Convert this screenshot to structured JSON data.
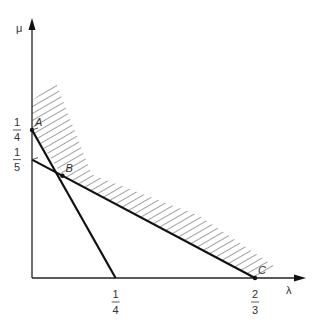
{
  "chart_data": {
    "type": "line",
    "title": "",
    "xlabel": "λ",
    "ylabel": "μ",
    "xlim": [
      0,
      0.76
    ],
    "ylim": [
      0,
      0.46
    ],
    "x_ticks": [
      {
        "value": 0.25,
        "num": "1",
        "den": "4"
      },
      {
        "value": 0.6667,
        "num": "2",
        "den": "3"
      }
    ],
    "y_ticks": [
      {
        "value": 0.25,
        "num": "1",
        "den": "4"
      },
      {
        "value": 0.2,
        "num": "1",
        "den": "5"
      }
    ],
    "lines": [
      {
        "name": "line-A-to-quarter",
        "points": [
          [
            0,
            0.25
          ],
          [
            0.25,
            0
          ]
        ]
      },
      {
        "name": "line-fifth-to-C",
        "points": [
          [
            0,
            0.2
          ],
          [
            0.6667,
            0
          ]
        ]
      }
    ],
    "points": [
      {
        "label": "A",
        "x": 0,
        "y": 0.25
      },
      {
        "label": "B",
        "x": 0.0909,
        "y": 0.1727
      },
      {
        "label": "C",
        "x": 0.6667,
        "y": 0
      }
    ],
    "hatched_region": {
      "description": "feasible region above lower envelope A-B-C",
      "lower_boundary": [
        [
          0,
          0.25
        ],
        [
          0.0909,
          0.1727
        ],
        [
          0.6667,
          0
        ]
      ],
      "outer_boundary": [
        [
          0,
          0.3
        ],
        [
          0.0714,
          0.33
        ],
        [
          0.1786,
          0.175
        ],
        [
          0.5,
          0.105
        ],
        [
          0.7321,
          0.017
        ]
      ]
    }
  }
}
